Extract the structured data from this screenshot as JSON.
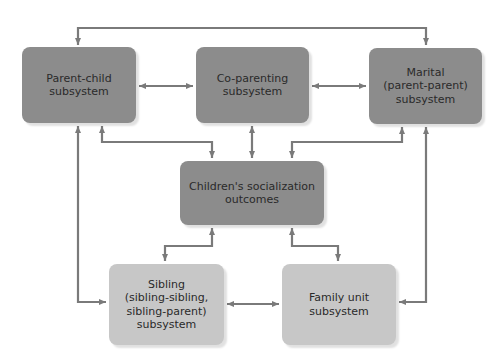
{
  "diagram": {
    "nodes": {
      "parent_child": {
        "label": "Parent-child\nsubsystem"
      },
      "co_parenting": {
        "label": "Co-parenting\nsubsystem"
      },
      "marital": {
        "label": "Marital\n(parent-parent)\nsubsystem"
      },
      "children_outcomes": {
        "label": "Children's socialization\noutcomes"
      },
      "sibling": {
        "label": "Sibling\n(sibling-sibling,\nsibling-parent)\nsubsystem"
      },
      "family_unit": {
        "label": "Family unit\nsubsystem"
      }
    },
    "edges": [
      {
        "from": "parent_child",
        "to": "marital",
        "direction": "both"
      },
      {
        "from": "parent_child",
        "to": "co_parenting",
        "direction": "both"
      },
      {
        "from": "co_parenting",
        "to": "marital",
        "direction": "both"
      },
      {
        "from": "parent_child",
        "to": "children_outcomes",
        "direction": "both"
      },
      {
        "from": "co_parenting",
        "to": "children_outcomes",
        "direction": "both"
      },
      {
        "from": "marital",
        "to": "children_outcomes",
        "direction": "both"
      },
      {
        "from": "parent_child",
        "to": "sibling",
        "direction": "both"
      },
      {
        "from": "marital",
        "to": "family_unit",
        "direction": "both"
      },
      {
        "from": "children_outcomes",
        "to": "sibling",
        "direction": "both"
      },
      {
        "from": "children_outcomes",
        "to": "family_unit",
        "direction": "both"
      },
      {
        "from": "sibling",
        "to": "family_unit",
        "direction": "both"
      }
    ],
    "colors": {
      "upper_box": "#8c8c8c",
      "lower_box": "#c7c7c7",
      "arrow": "#7a7a7a",
      "text": "#2a2a2a"
    }
  }
}
